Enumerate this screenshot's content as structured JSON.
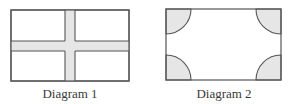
{
  "diagrams": [
    {
      "id": 1,
      "caption": "Diagram 1",
      "description": "Rectangle divided by a shaded cross (one vertical band and one horizontal band) into four white rectangles",
      "shape": "rectangle-with-cross"
    },
    {
      "id": 2,
      "caption": "Diagram 2",
      "description": "Rectangle with shaded quarter-circles in each of the four corners",
      "shape": "rectangle-with-corner-quarter-circles"
    }
  ],
  "colors": {
    "outline": "#555555",
    "shade": "#e6e6e6",
    "background": "#ffffff",
    "text": "#3a3a3a"
  }
}
